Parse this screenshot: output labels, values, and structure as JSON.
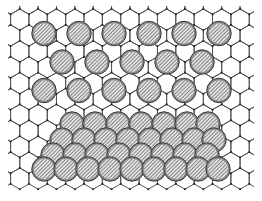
{
  "figure": {
    "width": 262,
    "height": 201,
    "background_color": "#ffffff"
  },
  "substrate": {
    "name": "hexagonal-lattice",
    "description": "Honeycomb (graphene-like) lattice of vertices joined by bonds, pointy-top hexagons",
    "bond_color": "#555555",
    "vertex_color": "#222222",
    "bond_width": 1.0,
    "vertex_size": 1.8,
    "hex_circumradius": 10.6,
    "hex_width": 18.4,
    "hex_height": 21.2,
    "origin_x": 10,
    "origin_y": 9,
    "columns": 14,
    "rows": 10
  },
  "particles": {
    "name": "hatched-circles",
    "radius": 12.2,
    "fill_color": "#d8d8d8",
    "hatch_color": "#4a4a4a",
    "ring_color": "#8a8a8a",
    "edge_color": "#3a3a3a",
    "hatch_angle_deg": 45,
    "hatch_spacing": 2.6,
    "ordered_layer": {
      "label": "ordered-adlayer",
      "rows": [
        {
          "y": 33.5,
          "xs": [
            44,
            79,
            114,
            149,
            184,
            219
          ]
        },
        {
          "y": 62.0,
          "xs": [
            62,
            97,
            132,
            167,
            202
          ]
        },
        {
          "y": 90.5,
          "xs": [
            44,
            79,
            114,
            149,
            184,
            219
          ]
        }
      ]
    },
    "cluster_layer": {
      "label": "disordered-cluster",
      "rows": [
        {
          "y": 124.0,
          "xs": [
            72,
            95,
            118,
            141,
            164,
            187,
            208
          ]
        },
        {
          "y": 140.0,
          "xs": [
            62,
            84,
            106,
            128,
            150,
            172,
            194,
            214
          ]
        },
        {
          "y": 155.0,
          "xs": [
            53,
            75,
            97,
            119,
            141,
            163,
            185,
            207
          ]
        },
        {
          "y": 169.0,
          "xs": [
            44,
            66,
            88,
            110,
            132,
            154,
            176,
            198,
            218
          ]
        }
      ]
    }
  },
  "legend": {
    "visible": false,
    "items": []
  },
  "axes": {
    "visible": false,
    "xlabel": "",
    "ylabel": ""
  },
  "annotations": []
}
